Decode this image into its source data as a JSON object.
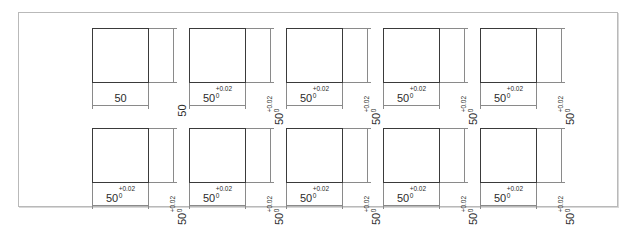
{
  "sheet": {
    "title": "Engineering dimension tolerance comparison sheet",
    "frame_color": "#b9b9b9",
    "background": "#ffffff",
    "outline_color": "#3a3a3a",
    "dimension_line_color": "#8a8a8a"
  },
  "figures": [
    {
      "id": "figure-1",
      "row": 0,
      "col": 0,
      "width_dimension": {
        "value": "50",
        "upper_tolerance": "",
        "lower_tolerance": "",
        "has_tolerance": false
      },
      "height_dimension": {
        "value": "50",
        "upper_tolerance": "",
        "lower_tolerance": "",
        "has_tolerance": false
      }
    },
    {
      "id": "figure-2",
      "row": 0,
      "col": 1,
      "width_dimension": {
        "value": "50",
        "upper_tolerance": "+0.02",
        "lower_tolerance": "0",
        "has_tolerance": true
      },
      "height_dimension": {
        "value": "50",
        "upper_tolerance": "+0.02",
        "lower_tolerance": "0",
        "has_tolerance": true
      }
    },
    {
      "id": "figure-3",
      "row": 0,
      "col": 2,
      "width_dimension": {
        "value": "50",
        "upper_tolerance": "+0.02",
        "lower_tolerance": "0",
        "has_tolerance": true
      },
      "height_dimension": {
        "value": "50",
        "upper_tolerance": "+0.02",
        "lower_tolerance": "0",
        "has_tolerance": true
      }
    },
    {
      "id": "figure-4",
      "row": 0,
      "col": 3,
      "width_dimension": {
        "value": "50",
        "upper_tolerance": "+0.02",
        "lower_tolerance": "0",
        "has_tolerance": true
      },
      "height_dimension": {
        "value": "50",
        "upper_tolerance": "+0.02",
        "lower_tolerance": "0",
        "has_tolerance": true
      }
    },
    {
      "id": "figure-5",
      "row": 0,
      "col": 4,
      "width_dimension": {
        "value": "50",
        "upper_tolerance": "+0.02",
        "lower_tolerance": "0",
        "has_tolerance": true
      },
      "height_dimension": {
        "value": "50",
        "upper_tolerance": "+0.02",
        "lower_tolerance": "0",
        "has_tolerance": true
      }
    },
    {
      "id": "figure-6",
      "row": 1,
      "col": 0,
      "width_dimension": {
        "value": "50",
        "upper_tolerance": "+0.02",
        "lower_tolerance": "0",
        "has_tolerance": true
      },
      "height_dimension": {
        "value": "50",
        "upper_tolerance": "+0.02",
        "lower_tolerance": "0",
        "has_tolerance": true
      }
    },
    {
      "id": "figure-7",
      "row": 1,
      "col": 1,
      "width_dimension": {
        "value": "50",
        "upper_tolerance": "+0.02",
        "lower_tolerance": "0",
        "has_tolerance": true
      },
      "height_dimension": {
        "value": "50",
        "upper_tolerance": "+0.02",
        "lower_tolerance": "0",
        "has_tolerance": true
      }
    },
    {
      "id": "figure-8",
      "row": 1,
      "col": 2,
      "width_dimension": {
        "value": "50",
        "upper_tolerance": "+0.02",
        "lower_tolerance": "0",
        "has_tolerance": true
      },
      "height_dimension": {
        "value": "50",
        "upper_tolerance": "+0.02",
        "lower_tolerance": "0",
        "has_tolerance": true
      }
    },
    {
      "id": "figure-9",
      "row": 1,
      "col": 3,
      "width_dimension": {
        "value": "50",
        "upper_tolerance": "+0.02",
        "lower_tolerance": "0",
        "has_tolerance": true
      },
      "height_dimension": {
        "value": "50",
        "upper_tolerance": "+0.02",
        "lower_tolerance": "0",
        "has_tolerance": true
      }
    },
    {
      "id": "figure-10",
      "row": 1,
      "col": 4,
      "width_dimension": {
        "value": "50",
        "upper_tolerance": "+0.02",
        "lower_tolerance": "0",
        "has_tolerance": true
      },
      "height_dimension": {
        "value": "50",
        "upper_tolerance": "+0.02",
        "lower_tolerance": "0",
        "has_tolerance": true
      }
    }
  ],
  "layout": {
    "columns": 5,
    "rows": 2,
    "col_spacing": 97,
    "row_spacing": 100,
    "origin_x": 73,
    "origin_y": 15
  }
}
